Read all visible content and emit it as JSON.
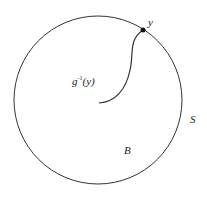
{
  "diagram": {
    "labels": {
      "point": "y",
      "preimage": "g",
      "preimage_sup": "-1",
      "preimage_arg": "(y)",
      "boundary": "S",
      "ball": "B"
    },
    "colors": {
      "stroke": "#333333",
      "background": "#ffffff"
    }
  }
}
